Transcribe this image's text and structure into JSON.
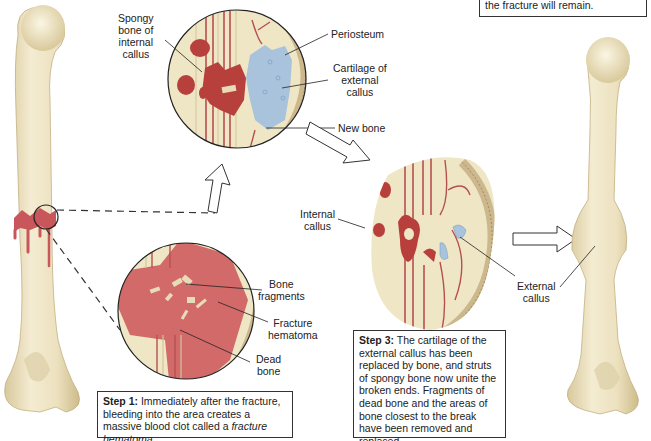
{
  "colors": {
    "bone": "#efe6c6",
    "bone_shade": "#d9cba0",
    "blood": "#c9565a",
    "blood_dark": "#a83a3c",
    "hematoma": "#d26a6a",
    "cartilage": "#a9c3dd",
    "periosteum": "#cdb88e",
    "outline": "#222222"
  },
  "labels": {
    "spongy_bone": [
      "Spongy",
      "bone of",
      "internal",
      "callus"
    ],
    "periosteum": "Periosteum",
    "cartilage_external_callus": [
      "Cartilage of",
      "external",
      "callus"
    ],
    "new_bone": "New bone",
    "internal_callus": [
      "Internal",
      "callus"
    ],
    "external_callus": [
      "External",
      "callus"
    ],
    "bone_fragments": [
      "Bone",
      "fragments"
    ],
    "fracture_hematoma": [
      "Fracture",
      "hematoma"
    ],
    "dead_bone": [
      "Dead",
      "bone"
    ]
  },
  "steps": {
    "step1": {
      "title": "Step 1:",
      "text_a": " Immediately after the fracture, bleeding into the area creates a massive blood clot called a ",
      "text_em": "fracture hematoma",
      "text_b": "."
    },
    "step3": {
      "title": "Step 3:",
      "text": " The cartilage of the external callus has been replaced by bone, and struts of spongy bone now unite the broken ends. Fragments of dead bone and the areas of bone closest to the break have been removed and replaced."
    },
    "step4_partial": {
      "text": "the fracture will remain."
    }
  }
}
